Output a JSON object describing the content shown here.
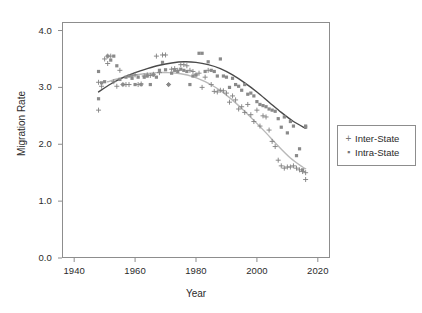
{
  "chart_data": {
    "type": "scatter",
    "title": "",
    "xlabel": "Year",
    "ylabel": "Migration Rate",
    "xlim": [
      1936,
      2024
    ],
    "ylim": [
      0.0,
      4.15
    ],
    "grid": false,
    "legend_position": "right",
    "xticks": [
      1940,
      1960,
      1980,
      2000,
      2020
    ],
    "xtick_labels": [
      "1940",
      "1960",
      "1980",
      "2000",
      "2020"
    ],
    "yticks": [
      0.0,
      1.0,
      2.0,
      3.0,
      4.0
    ],
    "ytick_labels": [
      "0.0",
      "1.0",
      "2.0",
      "3.0",
      "4.0"
    ],
    "series": [
      {
        "name": "Inter-State",
        "marker": "plus",
        "color": "#808080",
        "points": [
          [
            1948,
            3.09
          ],
          [
            1948,
            2.6
          ],
          [
            1949,
            3.02
          ],
          [
            1950,
            3.5
          ],
          [
            1951,
            3.42
          ],
          [
            1951,
            3.55
          ],
          [
            1952,
            3.55
          ],
          [
            1953,
            3.1
          ],
          [
            1954,
            3.02
          ],
          [
            1955,
            3.3
          ],
          [
            1956,
            3.05
          ],
          [
            1957,
            3.05
          ],
          [
            1958,
            3.05
          ],
          [
            1959,
            3.2
          ],
          [
            1960,
            3.22
          ],
          [
            1961,
            3.05
          ],
          [
            1962,
            3.06
          ],
          [
            1963,
            3.2
          ],
          [
            1964,
            3.22
          ],
          [
            1965,
            3.21
          ],
          [
            1966,
            3.23
          ],
          [
            1967,
            3.55
          ],
          [
            1968,
            3.26
          ],
          [
            1969,
            3.57
          ],
          [
            1970,
            3.57
          ],
          [
            1971,
            3.05
          ],
          [
            1972,
            3.32
          ],
          [
            1973,
            3.33
          ],
          [
            1974,
            3.3
          ],
          [
            1975,
            3.4
          ],
          [
            1976,
            3.4
          ],
          [
            1977,
            3.38
          ],
          [
            1978,
            3.3
          ],
          [
            1979,
            3.28
          ],
          [
            1980,
            3.22
          ],
          [
            1981,
            3.25
          ],
          [
            1982,
            3.0
          ],
          [
            1983,
            3.18
          ],
          [
            1984,
            3.3
          ],
          [
            1985,
            3.05
          ],
          [
            1986,
            2.93
          ],
          [
            1987,
            2.92
          ],
          [
            1988,
            2.95
          ],
          [
            1989,
            2.94
          ],
          [
            1990,
            2.9
          ],
          [
            1991,
            2.74
          ],
          [
            1992,
            2.85
          ],
          [
            1993,
            2.78
          ],
          [
            1994,
            2.62
          ],
          [
            1995,
            2.66
          ],
          [
            1996,
            2.56
          ],
          [
            1997,
            2.7
          ],
          [
            1998,
            2.52
          ],
          [
            1999,
            2.4
          ],
          [
            2000,
            2.6
          ],
          [
            2001,
            2.32
          ],
          [
            2002,
            2.5
          ],
          [
            2003,
            2.48
          ],
          [
            2004,
            2.25
          ],
          [
            2005,
            2.05
          ],
          [
            2006,
            1.96
          ],
          [
            2007,
            1.72
          ],
          [
            2008,
            1.62
          ],
          [
            2009,
            1.58
          ],
          [
            2010,
            1.6
          ],
          [
            2011,
            1.6
          ],
          [
            2012,
            1.62
          ],
          [
            2013,
            1.58
          ],
          [
            2014,
            1.55
          ],
          [
            2015,
            1.52
          ],
          [
            2016,
            1.5
          ],
          [
            2016,
            1.38
          ]
        ]
      },
      {
        "name": "Intra-State",
        "marker": "square",
        "color": "#8a8a8a",
        "points": [
          [
            1948,
            3.28
          ],
          [
            1948,
            2.8
          ],
          [
            1949,
            3.08
          ],
          [
            1950,
            3.1
          ],
          [
            1951,
            3.55
          ],
          [
            1952,
            3.48
          ],
          [
            1953,
            3.55
          ],
          [
            1954,
            3.38
          ],
          [
            1955,
            3.14
          ],
          [
            1956,
            3.05
          ],
          [
            1957,
            3.18
          ],
          [
            1958,
            3.2
          ],
          [
            1959,
            3.16
          ],
          [
            1960,
            3.05
          ],
          [
            1961,
            3.18
          ],
          [
            1962,
            3.05
          ],
          [
            1963,
            3.18
          ],
          [
            1964,
            3.2
          ],
          [
            1965,
            3.05
          ],
          [
            1966,
            3.22
          ],
          [
            1967,
            3.18
          ],
          [
            1968,
            3.3
          ],
          [
            1969,
            3.44
          ],
          [
            1970,
            3.31
          ],
          [
            1971,
            3.05
          ],
          [
            1972,
            3.25
          ],
          [
            1973,
            3.3
          ],
          [
            1974,
            3.28
          ],
          [
            1975,
            3.32
          ],
          [
            1976,
            3.3
          ],
          [
            1977,
            3.28
          ],
          [
            1978,
            3.05
          ],
          [
            1979,
            3.2
          ],
          [
            1980,
            3.22
          ],
          [
            1981,
            3.6
          ],
          [
            1982,
            3.6
          ],
          [
            1983,
            3.28
          ],
          [
            1984,
            3.45
          ],
          [
            1985,
            3.3
          ],
          [
            1986,
            3.28
          ],
          [
            1987,
            3.2
          ],
          [
            1988,
            3.5
          ],
          [
            1989,
            3.2
          ],
          [
            1990,
            3.18
          ],
          [
            1991,
            3.0
          ],
          [
            1992,
            3.16
          ],
          [
            1993,
            3.05
          ],
          [
            1994,
            3.02
          ],
          [
            1995,
            2.95
          ],
          [
            1996,
            3.05
          ],
          [
            1997,
            2.88
          ],
          [
            1998,
            2.9
          ],
          [
            1999,
            2.85
          ],
          [
            2000,
            2.75
          ],
          [
            2001,
            2.7
          ],
          [
            2002,
            2.68
          ],
          [
            2003,
            2.66
          ],
          [
            2004,
            2.62
          ],
          [
            2005,
            2.6
          ],
          [
            2006,
            2.58
          ],
          [
            2007,
            2.45
          ],
          [
            2008,
            2.3
          ],
          [
            2009,
            2.48
          ],
          [
            2010,
            2.2
          ],
          [
            2011,
            2.4
          ],
          [
            2012,
            2.32
          ],
          [
            2013,
            1.8
          ],
          [
            2014,
            1.92
          ],
          [
            2015,
            1.55
          ],
          [
            2016,
            2.32
          ],
          [
            2016,
            2.3
          ]
        ]
      }
    ],
    "trend_curves": [
      {
        "name": "Intra-State-trend",
        "color": "#4a4a4a",
        "width": 1.4,
        "points": [
          [
            1948,
            2.92
          ],
          [
            1952,
            3.06
          ],
          [
            1956,
            3.17
          ],
          [
            1960,
            3.26
          ],
          [
            1964,
            3.33
          ],
          [
            1968,
            3.39
          ],
          [
            1972,
            3.43
          ],
          [
            1976,
            3.45
          ],
          [
            1980,
            3.44
          ],
          [
            1984,
            3.4
          ],
          [
            1988,
            3.33
          ],
          [
            1992,
            3.22
          ],
          [
            1996,
            3.08
          ],
          [
            2000,
            2.92
          ],
          [
            2004,
            2.74
          ],
          [
            2008,
            2.56
          ],
          [
            2012,
            2.4
          ],
          [
            2016,
            2.28
          ]
        ]
      },
      {
        "name": "Inter-State-trend",
        "color": "#b9b9b9",
        "width": 1.4,
        "points": [
          [
            1951,
            3.1
          ],
          [
            1955,
            3.16
          ],
          [
            1959,
            3.21
          ],
          [
            1963,
            3.24
          ],
          [
            1967,
            3.26
          ],
          [
            1971,
            3.26
          ],
          [
            1975,
            3.24
          ],
          [
            1979,
            3.19
          ],
          [
            1983,
            3.1
          ],
          [
            1987,
            2.98
          ],
          [
            1991,
            2.82
          ],
          [
            1995,
            2.63
          ],
          [
            1999,
            2.42
          ],
          [
            2003,
            2.2
          ],
          [
            2007,
            1.97
          ],
          [
            2011,
            1.76
          ],
          [
            2015,
            1.6
          ],
          [
            2016,
            1.57
          ]
        ]
      }
    ]
  },
  "axes": {
    "ylabel": "Migration Rate",
    "xlabel": "Year"
  },
  "legend": {
    "entries": [
      {
        "key": "+",
        "label": "Inter-State"
      },
      {
        "key": "▪",
        "label": "Intra-State"
      }
    ]
  }
}
